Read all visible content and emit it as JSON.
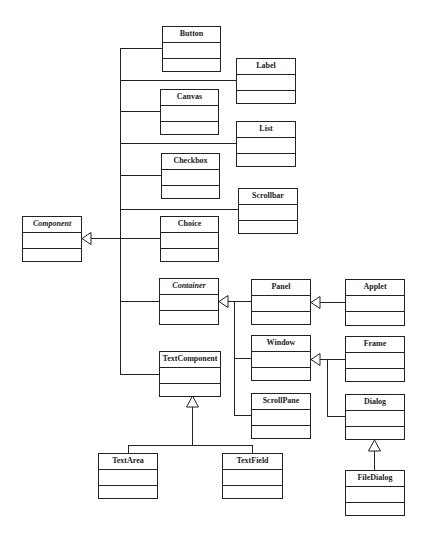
{
  "diagram": {
    "type": "UML class hierarchy",
    "classes": [
      {
        "id": "button",
        "name": "Button",
        "abstract": false
      },
      {
        "id": "label",
        "name": "Label",
        "abstract": false
      },
      {
        "id": "canvas",
        "name": "Canvas",
        "abstract": false
      },
      {
        "id": "list",
        "name": "List",
        "abstract": false
      },
      {
        "id": "checkbox",
        "name": "Checkbox",
        "abstract": false
      },
      {
        "id": "scrollbar",
        "name": "Scrollbar",
        "abstract": false
      },
      {
        "id": "component",
        "name": "Component",
        "abstract": true
      },
      {
        "id": "choice",
        "name": "Choice",
        "abstract": false
      },
      {
        "id": "container",
        "name": "Container",
        "abstract": true
      },
      {
        "id": "panel",
        "name": "Panel",
        "abstract": false
      },
      {
        "id": "applet",
        "name": "Applet",
        "abstract": false
      },
      {
        "id": "window",
        "name": "Window",
        "abstract": false
      },
      {
        "id": "frame",
        "name": "Frame",
        "abstract": false
      },
      {
        "id": "textcomponent",
        "name": "TextComponent",
        "abstract": false
      },
      {
        "id": "scrollpane",
        "name": "ScrollPane",
        "abstract": false
      },
      {
        "id": "dialog",
        "name": "Dialog",
        "abstract": false
      },
      {
        "id": "textarea",
        "name": "TextArea",
        "abstract": false
      },
      {
        "id": "textfield",
        "name": "TextField",
        "abstract": false
      },
      {
        "id": "filedialog",
        "name": "FileDialog",
        "abstract": false
      }
    ],
    "inheritance": [
      {
        "child": "Button",
        "parent": "Component"
      },
      {
        "child": "Label",
        "parent": "Component"
      },
      {
        "child": "Canvas",
        "parent": "Component"
      },
      {
        "child": "List",
        "parent": "Component"
      },
      {
        "child": "Checkbox",
        "parent": "Component"
      },
      {
        "child": "Scrollbar",
        "parent": "Component"
      },
      {
        "child": "Choice",
        "parent": "Component"
      },
      {
        "child": "Container",
        "parent": "Component"
      },
      {
        "child": "TextComponent",
        "parent": "Component"
      },
      {
        "child": "Panel",
        "parent": "Container"
      },
      {
        "child": "Window",
        "parent": "Container"
      },
      {
        "child": "ScrollPane",
        "parent": "Container"
      },
      {
        "child": "Applet",
        "parent": "Panel"
      },
      {
        "child": "Frame",
        "parent": "Window"
      },
      {
        "child": "Dialog",
        "parent": "Window"
      },
      {
        "child": "FileDialog",
        "parent": "Dialog"
      },
      {
        "child": "TextArea",
        "parent": "TextComponent"
      },
      {
        "child": "TextField",
        "parent": "TextComponent"
      }
    ],
    "colors": {
      "line": "#222222",
      "background": "#ffffff"
    }
  }
}
